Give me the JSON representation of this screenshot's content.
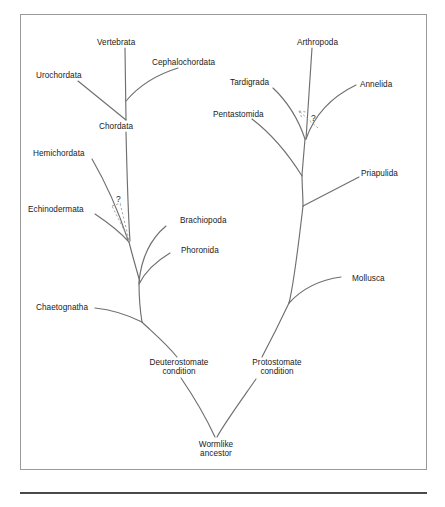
{
  "figure": {
    "kind": "phylogenetic-tree",
    "root_label": "Wormlike ancestor",
    "border_color": "#9a9a9a",
    "line_color": "#6f6f6f",
    "dashed_line_color": "#9c9c9c",
    "text_color": "#1a1a1a",
    "background": "#ffffff"
  },
  "nodes": {
    "wormlike_ancestor": {
      "label_line1": "Wormlike",
      "label_line2": "ancestor"
    },
    "deuterostomate": {
      "label_line1": "Deuterostomate",
      "label_line2": "condition"
    },
    "protostomate": {
      "label_line1": "Protostomate",
      "label_line2": "condition"
    },
    "chordata": {
      "label": "Chordata"
    }
  },
  "taxa": {
    "deuterostome_branch": [
      {
        "id": "vertebrata",
        "label": "Vertebrata"
      },
      {
        "id": "cephalochordata",
        "label": "Cephalochordata"
      },
      {
        "id": "urochordata",
        "label": "Urochordata"
      },
      {
        "id": "hemichordata",
        "label": "Hemichordata"
      },
      {
        "id": "echinodermata",
        "label": "Echinodermata"
      },
      {
        "id": "brachiopoda",
        "label": "Brachiopoda"
      },
      {
        "id": "phoronida",
        "label": "Phoronida"
      },
      {
        "id": "chaetognatha",
        "label": "Chaetognatha"
      }
    ],
    "protostome_branch": [
      {
        "id": "arthropoda",
        "label": "Arthropoda"
      },
      {
        "id": "tardigrada",
        "label": "Tardigrada"
      },
      {
        "id": "annelida",
        "label": "Annelida"
      },
      {
        "id": "pentastomida",
        "label": "Pentastomida"
      },
      {
        "id": "priapulida",
        "label": "Priapulida"
      },
      {
        "id": "mollusca",
        "label": "Mollusca"
      }
    ]
  },
  "annotations": {
    "uncertainty_left": {
      "label": "?"
    },
    "uncertainty_right": {
      "label": "?"
    }
  }
}
